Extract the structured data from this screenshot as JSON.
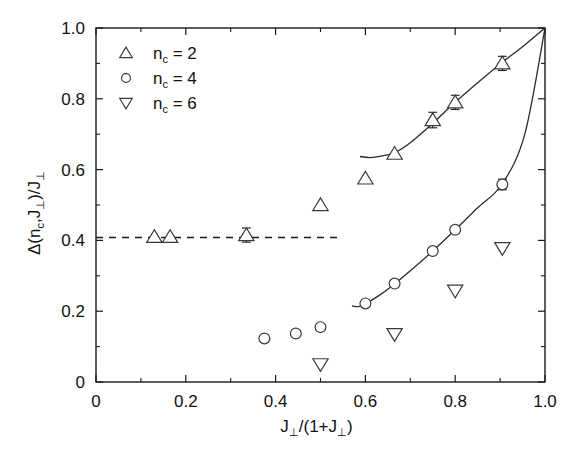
{
  "chart_data": {
    "type": "scatter",
    "title": "",
    "xlabel": "J⊥/(1+J⊥)",
    "ylabel": "Δ(n_c,J⊥)/J⊥",
    "xlim": [
      0.0,
      1.0
    ],
    "ylim": [
      0.0,
      1.0
    ],
    "grid": false,
    "legend_position": "upper-left",
    "x_ticks": [
      "0",
      "0.2",
      "0.4",
      "0.6",
      "0.8",
      "1.0"
    ],
    "x_tick_values": [
      0.0,
      0.2,
      0.4,
      0.6,
      0.8,
      1.0
    ],
    "y_ticks": [
      "0",
      "0.2",
      "0.4",
      "0.6",
      "0.8",
      "1.0"
    ],
    "y_tick_values": [
      0.0,
      0.2,
      0.4,
      0.6,
      0.8,
      1.0
    ],
    "minor_ticks_per_interval": 1,
    "series": [
      {
        "name": "n_c = 2",
        "marker": "triangle-up",
        "points": [
          {
            "x": 0.13,
            "y": 0.41,
            "yerr": 0.0
          },
          {
            "x": 0.165,
            "y": 0.41,
            "yerr": 0.0
          },
          {
            "x": 0.335,
            "y": 0.415,
            "yerr": 0.02
          },
          {
            "x": 0.5,
            "y": 0.5,
            "yerr": 0.0
          },
          {
            "x": 0.6,
            "y": 0.575,
            "yerr": 0.0
          },
          {
            "x": 0.665,
            "y": 0.645,
            "yerr": 0.0
          },
          {
            "x": 0.75,
            "y": 0.74,
            "yerr": 0.022
          },
          {
            "x": 0.8,
            "y": 0.79,
            "yerr": 0.02
          },
          {
            "x": 0.905,
            "y": 0.9,
            "yerr": 0.02
          }
        ]
      },
      {
        "name": "n_c = 4",
        "marker": "circle",
        "points": [
          {
            "x": 0.375,
            "y": 0.123,
            "yerr": 0.0
          },
          {
            "x": 0.445,
            "y": 0.137,
            "yerr": 0.0
          },
          {
            "x": 0.5,
            "y": 0.155,
            "yerr": 0.0
          },
          {
            "x": 0.6,
            "y": 0.222,
            "yerr": 0.0
          },
          {
            "x": 0.665,
            "y": 0.278,
            "yerr": 0.0
          },
          {
            "x": 0.75,
            "y": 0.37,
            "yerr": 0.0
          },
          {
            "x": 0.8,
            "y": 0.43,
            "yerr": 0.0
          },
          {
            "x": 0.905,
            "y": 0.558,
            "yerr": 0.015
          }
        ]
      },
      {
        "name": "n_c = 6",
        "marker": "triangle-down",
        "points": [
          {
            "x": 0.5,
            "y": 0.05,
            "yerr": 0.0
          },
          {
            "x": 0.665,
            "y": 0.135,
            "yerr": 0.0
          },
          {
            "x": 0.8,
            "y": 0.258,
            "yerr": 0.0
          },
          {
            "x": 0.905,
            "y": 0.378,
            "yerr": 0.0
          }
        ]
      }
    ],
    "fit_curves": [
      {
        "for_series": "n_c = 2",
        "points": [
          {
            "x": 0.588,
            "y": 0.637
          },
          {
            "x": 0.61,
            "y": 0.634
          },
          {
            "x": 0.635,
            "y": 0.638
          },
          {
            "x": 0.665,
            "y": 0.648
          },
          {
            "x": 0.7,
            "y": 0.676
          },
          {
            "x": 0.75,
            "y": 0.731
          },
          {
            "x": 0.8,
            "y": 0.79
          },
          {
            "x": 0.85,
            "y": 0.845
          },
          {
            "x": 0.905,
            "y": 0.903
          },
          {
            "x": 0.955,
            "y": 0.952
          },
          {
            "x": 1.0,
            "y": 1.0
          }
        ]
      },
      {
        "for_series": "n_c = 4",
        "points": [
          {
            "x": 0.57,
            "y": 0.215
          },
          {
            "x": 0.585,
            "y": 0.213
          },
          {
            "x": 0.6,
            "y": 0.221
          },
          {
            "x": 0.63,
            "y": 0.244
          },
          {
            "x": 0.665,
            "y": 0.277
          },
          {
            "x": 0.7,
            "y": 0.314
          },
          {
            "x": 0.75,
            "y": 0.37
          },
          {
            "x": 0.8,
            "y": 0.43
          },
          {
            "x": 0.85,
            "y": 0.492
          },
          {
            "x": 0.905,
            "y": 0.56
          },
          {
            "x": 0.955,
            "y": 0.7
          },
          {
            "x": 1.0,
            "y": 1.0
          }
        ]
      }
    ],
    "reference_line": {
      "style": "dashed",
      "orientation": "horizontal",
      "y": 0.408,
      "x_start": 0.0,
      "x_end": 0.545
    },
    "annotations": []
  },
  "legend": {
    "entries": [
      {
        "marker": "triangle-up",
        "label": "n",
        "subscript": "c",
        "equals": "= 2"
      },
      {
        "marker": "circle",
        "label": "n",
        "subscript": "c",
        "equals": "= 4"
      },
      {
        "marker": "triangle-down",
        "label": "n",
        "subscript": "c",
        "equals": "= 6"
      }
    ]
  },
  "axes": {
    "x_title_main": "J",
    "x_title_sub": "⊥",
    "x_title_rest": "/(1+J",
    "x_title_sub2": "⊥",
    "x_title_end": ")",
    "y_title": "Δ(n",
    "y_title_sub": "c",
    "y_title_mid": ",J",
    "y_title_sub2": "⊥",
    "y_title_mid2": ")/J",
    "y_title_sub3": "⊥"
  }
}
